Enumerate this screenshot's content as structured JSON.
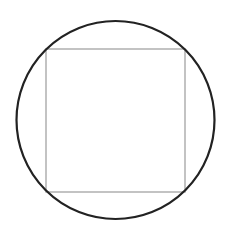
{
  "diagram": {
    "background": "#ffffff",
    "circle": {
      "cx": 115.5,
      "cy": 120,
      "r": 99,
      "stroke": "#222222",
      "stroke_width": 2.2
    },
    "square": {
      "x": 46,
      "y": 49,
      "width": 139,
      "height": 143,
      "stroke": "#aaaaaa",
      "stroke_width": 1.4
    }
  }
}
